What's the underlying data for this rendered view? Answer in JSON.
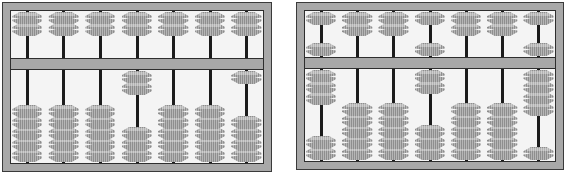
{
  "scene": {
    "title": "Two soroban abacuses side by side",
    "background_color": "#ffffff",
    "device_count": 2
  },
  "style": {
    "frame_color": "#a8a8a8",
    "frame_outline_color": "#2e2e2e",
    "deck_background_color": "#f4f4f4",
    "rod_color": "#1b1b1b",
    "bead_fill_color": "#a2a2a2",
    "bead_outline_color": "#242424",
    "bar_color": "#a8a8a8"
  },
  "abacuses": [
    {
      "name": "left-abacus",
      "label": "Left abacus",
      "rod_count": 7,
      "upper_beads_per_rod": 2,
      "lower_beads_per_rod": 5,
      "rods": [
        {
          "index": 1,
          "upper_at_bar": 0,
          "upper_at_top": 2,
          "lower_at_bar": 0,
          "lower_at_bottom": 5
        },
        {
          "index": 2,
          "upper_at_bar": 0,
          "upper_at_top": 2,
          "lower_at_bar": 0,
          "lower_at_bottom": 5
        },
        {
          "index": 3,
          "upper_at_bar": 0,
          "upper_at_top": 2,
          "lower_at_bar": 0,
          "lower_at_bottom": 5
        },
        {
          "index": 4,
          "upper_at_bar": 0,
          "upper_at_top": 2,
          "lower_at_bar": 2,
          "lower_at_bottom": 3
        },
        {
          "index": 5,
          "upper_at_bar": 0,
          "upper_at_top": 2,
          "lower_at_bar": 0,
          "lower_at_bottom": 5
        },
        {
          "index": 6,
          "upper_at_bar": 0,
          "upper_at_top": 2,
          "lower_at_bar": 0,
          "lower_at_bottom": 5
        },
        {
          "index": 7,
          "upper_at_bar": 0,
          "upper_at_top": 2,
          "lower_at_bar": 1,
          "lower_at_bottom": 4
        }
      ]
    },
    {
      "name": "right-abacus",
      "label": "Right abacus",
      "rod_count": 7,
      "upper_beads_per_rod": 2,
      "lower_beads_per_rod": 5,
      "rods": [
        {
          "index": 1,
          "upper_at_bar": 1,
          "upper_at_top": 1,
          "lower_at_bar": 3,
          "lower_at_bottom": 2
        },
        {
          "index": 2,
          "upper_at_bar": 0,
          "upper_at_top": 2,
          "lower_at_bar": 0,
          "lower_at_bottom": 5
        },
        {
          "index": 3,
          "upper_at_bar": 0,
          "upper_at_top": 2,
          "lower_at_bar": 0,
          "lower_at_bottom": 5
        },
        {
          "index": 4,
          "upper_at_bar": 1,
          "upper_at_top": 1,
          "lower_at_bar": 2,
          "lower_at_bottom": 3
        },
        {
          "index": 5,
          "upper_at_bar": 0,
          "upper_at_top": 2,
          "lower_at_bar": 0,
          "lower_at_bottom": 5
        },
        {
          "index": 6,
          "upper_at_bar": 0,
          "upper_at_top": 2,
          "lower_at_bar": 0,
          "lower_at_bottom": 5
        },
        {
          "index": 7,
          "upper_at_bar": 1,
          "upper_at_top": 1,
          "lower_at_bar": 4,
          "lower_at_bottom": 1
        }
      ]
    }
  ]
}
